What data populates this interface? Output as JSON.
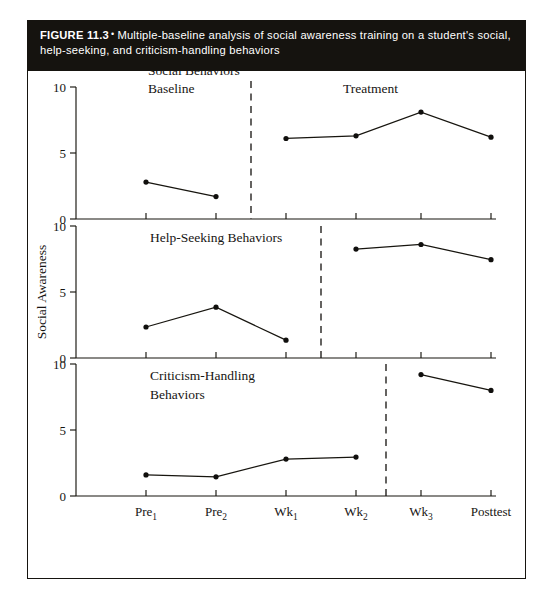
{
  "caption": {
    "figure_number": "FIGURE 11.3",
    "separator": "•",
    "text": "Multiple-baseline analysis of social awareness training on a student's social, help-seeking, and criticism-handling behaviors"
  },
  "axes": {
    "y_axis_title": "Social Awareness",
    "y_ticks": [
      "0",
      "5",
      "10"
    ],
    "x_ticks": [
      {
        "base": "Pre",
        "sub": "1"
      },
      {
        "base": "Pre",
        "sub": "2"
      },
      {
        "base": "Wk",
        "sub": "1"
      },
      {
        "base": "Wk",
        "sub": "2"
      },
      {
        "base": "Wk",
        "sub": "3"
      },
      {
        "base": "Posttest",
        "sub": ""
      }
    ]
  },
  "phase_labels": {
    "baseline": "Baseline",
    "treatment": "Treatment"
  },
  "panels": [
    {
      "label_line1": "Social Behaviors",
      "label_line2": ""
    },
    {
      "label_line1": "Help-Seeking Behaviors",
      "label_line2": ""
    },
    {
      "label_line1": "Criticism-Handling",
      "label_line2": "Behaviors"
    }
  ],
  "colors": {
    "caption_bar": "#15130f",
    "caption_text": "#ffffff",
    "ink": "#17150f",
    "background": "#ffffff"
  },
  "chart_data": {
    "type": "line",
    "title": "Multiple-baseline analysis of social awareness training on a student's social, help-seeking, and criticism-handling behaviors",
    "xlabel": "",
    "ylabel": "Social Awareness",
    "ylim": [
      0,
      10
    ],
    "grid": false,
    "legend": "none",
    "x": [
      "Pre1",
      "Pre2",
      "Wk1",
      "Wk2",
      "Wk3",
      "Posttest"
    ],
    "panels": [
      {
        "name": "Social Behaviors",
        "baseline_phase_label": "Baseline",
        "treatment_phase_label": "Treatment",
        "divider_between": [
          "Pre2",
          "Wk1"
        ],
        "series": [
          {
            "name": "Baseline",
            "x": [
              "Pre1",
              "Pre2"
            ],
            "values": [
              2.8,
              1.7
            ]
          },
          {
            "name": "Treatment",
            "x": [
              "Wk1",
              "Wk2",
              "Wk3",
              "Posttest"
            ],
            "values": [
              6.1,
              6.3,
              8.1,
              6.2
            ]
          }
        ]
      },
      {
        "name": "Help-Seeking Behaviors",
        "divider_between": [
          "Wk1",
          "Wk2"
        ],
        "series": [
          {
            "name": "Baseline",
            "x": [
              "Pre1",
              "Pre2",
              "Wk1"
            ],
            "values": [
              2.35,
              3.85,
              1.35
            ]
          },
          {
            "name": "Treatment",
            "x": [
              "Wk2",
              "Wk3",
              "Posttest"
            ],
            "values": [
              8.25,
              8.6,
              7.45
            ]
          }
        ]
      },
      {
        "name": "Criticism-Handling Behaviors",
        "divider_between": [
          "Wk2",
          "Wk3"
        ],
        "series": [
          {
            "name": "Baseline",
            "x": [
              "Pre1",
              "Pre2",
              "Wk1",
              "Wk2"
            ],
            "values": [
              1.6,
              1.45,
              2.8,
              2.95
            ]
          },
          {
            "name": "Treatment",
            "x": [
              "Wk3",
              "Posttest"
            ],
            "values": [
              9.2,
              8.0
            ]
          }
        ]
      }
    ]
  }
}
